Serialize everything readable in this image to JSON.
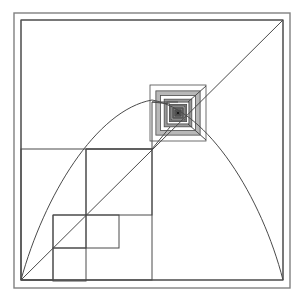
{
  "figure": {
    "canvas": {
      "width": 304,
      "height": 304
    },
    "background_color": "#ffffff",
    "line_color": "#4a4a4a",
    "frame_color": "#808080",
    "nest_dark_color": "#1a1a1a",
    "nest_light_color": "#ffffff"
  },
  "frame": {
    "outer": {
      "x": 14,
      "y": 13,
      "width": 276,
      "height": 275
    },
    "inner": {
      "x": 21,
      "y": 20,
      "width": 262,
      "height": 260
    }
  },
  "main_square": {
    "label": "main-square",
    "x": 21,
    "y": 20,
    "width": 262,
    "height": 260
  },
  "diagonal": {
    "label": "corner-diagonal",
    "from": {
      "x": 21,
      "y": 280
    },
    "to": {
      "x": 283,
      "y": 20
    }
  },
  "convergence_point": {
    "label": "vanishing-point",
    "x": 178,
    "y": 113
  },
  "staircase_squares": [
    {
      "index": 1,
      "x": 21,
      "y": 149,
      "size": 131
    },
    {
      "index": 2,
      "x": 86,
      "y": 149,
      "size": 66
    },
    {
      "index": 3,
      "x": 86,
      "y": 215,
      "size": 33
    },
    {
      "index": 4,
      "x": 53,
      "y": 215,
      "size": 33
    },
    {
      "index": 5,
      "x": 53,
      "y": 248,
      "size": 33
    }
  ],
  "staircase_path": {
    "label": "halving-staircase",
    "points": "21,280 53,280 53,248 53,215 86,215 86,149 152,149 152,102 178,102"
  },
  "arc": {
    "label": "parabolic-arc",
    "start": {
      "x": 21,
      "y": 280
    },
    "apex": {
      "x": 152,
      "y": 99
    },
    "end": {
      "x": 283,
      "y": 280
    },
    "path": "M 21,280 C 44,196 96,110 152,100 C 208,110 262,198 283,280"
  },
  "nested_squares": {
    "label": "nested-square-vanishing-point",
    "center": {
      "x": 178,
      "y": 113
    },
    "outer_half": 28,
    "rings": 13,
    "ratio": 0.79
  },
  "radial_edges": [
    {
      "label": "edge-upper-left",
      "from": {
        "x": 152,
        "y": 102
      },
      "to": {
        "x": 170,
        "y": 104
      }
    },
    {
      "label": "edge-lower-left",
      "from": {
        "x": 152,
        "y": 149
      },
      "to": {
        "x": 170,
        "y": 127
      }
    },
    {
      "label": "edge-lower-right",
      "from": {
        "x": 206,
        "y": 140
      },
      "to": {
        "x": 188,
        "y": 124
      }
    },
    {
      "label": "edge-upper-right",
      "from": {
        "x": 206,
        "y": 86
      },
      "to": {
        "x": 188,
        "y": 102
      }
    }
  ],
  "a11y": {
    "figure_role": "Mathematical geometry illustration",
    "alt_text": "A square frame containing a diagonal line from the bottom-left corner to the top-right corner, a staircase of progressively halving squares whose corners sit on the diagonal, an arc rising from the bottom-left corner to a peak near the center and falling to the bottom-right corner, and a tunnel of concentric squares at the convergence point."
  }
}
